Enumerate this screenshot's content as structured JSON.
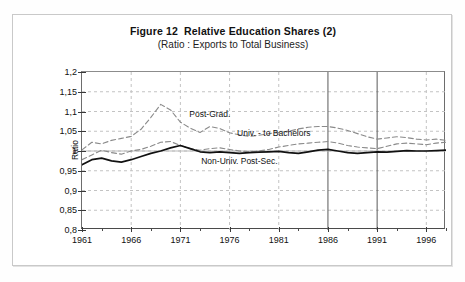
{
  "figure": {
    "title": "Figure 12  Relative Education Shares (2)",
    "subtitle": "(Ratio : Exports to Total Business)"
  },
  "colors": {
    "solid_series": "#111111",
    "dashed_series": "#8a8a8a",
    "gridline": "#c3c3c3",
    "axis": "#4a4a4a",
    "event_line": "#5a5a5a",
    "frame": "#c9c9c9",
    "background": "#ffffff"
  },
  "chart_data": {
    "type": "line",
    "title": "Figure 12  Relative Education Shares (2)",
    "subtitle": "(Ratio : Exports to Total Business)",
    "xlabel": "",
    "ylabel": "Ratio",
    "xlim": [
      1961,
      1998
    ],
    "ylim": [
      0.8,
      1.2
    ],
    "grid": true,
    "legend": "inline-annotations",
    "y_ticks": [
      0.8,
      0.85,
      0.9,
      0.95,
      1,
      1.05,
      1.1,
      1.15,
      1.2
    ],
    "y_tick_labels": [
      "0,8",
      "0,85",
      "0,9",
      "0,95",
      "1",
      "1,05",
      "1,1",
      "1,15",
      "1,2"
    ],
    "x_ticks_major": [
      1961,
      1966,
      1971,
      1976,
      1981,
      1986,
      1991,
      1996
    ],
    "x_tick_labels": [
      "1961",
      "1966",
      "1971",
      "1976",
      "1981",
      "1986",
      "1991",
      "1996"
    ],
    "x_ticks_minor": [
      1963,
      1968,
      1973,
      1978,
      1983,
      1988,
      1993,
      1998
    ],
    "event_lines": [
      1986,
      1991
    ],
    "x": [
      1961,
      1962,
      1963,
      1964,
      1965,
      1966,
      1967,
      1968,
      1969,
      1970,
      1971,
      1972,
      1973,
      1974,
      1975,
      1976,
      1977,
      1978,
      1979,
      1980,
      1981,
      1982,
      1983,
      1984,
      1985,
      1986,
      1987,
      1988,
      1989,
      1990,
      1991,
      1992,
      1993,
      1994,
      1995,
      1996,
      1997,
      1998
    ],
    "series": [
      {
        "name": "Post-Grad.",
        "style": "dashed",
        "color": "#8a8a8a",
        "values": [
          1.003,
          1.022,
          1.018,
          1.027,
          1.032,
          1.037,
          1.055,
          1.085,
          1.118,
          1.104,
          1.073,
          1.058,
          1.047,
          1.062,
          1.057,
          1.046,
          1.041,
          1.037,
          1.04,
          1.044,
          1.047,
          1.05,
          1.056,
          1.06,
          1.062,
          1.062,
          1.058,
          1.052,
          1.044,
          1.036,
          1.03,
          1.033,
          1.036,
          1.034,
          1.03,
          1.028,
          1.03,
          1.027
        ]
      },
      {
        "name": "Univ. - to Bachelors",
        "style": "dashed",
        "color": "#8a8a8a",
        "values": [
          0.978,
          0.99,
          1.002,
          0.996,
          0.992,
          1.0,
          1.004,
          1.012,
          1.022,
          1.024,
          1.014,
          1.006,
          1.002,
          1.006,
          1.008,
          1.004,
          1.0,
          0.998,
          1.0,
          1.004,
          1.01,
          1.014,
          1.018,
          1.02,
          1.022,
          1.024,
          1.02,
          1.014,
          1.01,
          1.008,
          1.006,
          1.012,
          1.018,
          1.02,
          1.018,
          1.016,
          1.02,
          1.022
        ]
      },
      {
        "name": "Non-Univ. Post-Sec.",
        "style": "solid",
        "color": "#111111",
        "values": [
          0.965,
          0.978,
          0.982,
          0.975,
          0.972,
          0.978,
          0.986,
          0.994,
          1.0,
          1.008,
          1.014,
          1.006,
          0.998,
          0.996,
          0.998,
          0.996,
          0.994,
          0.996,
          0.997,
          0.998,
          0.999,
          0.996,
          0.994,
          0.998,
          1.002,
          1.004,
          1.0,
          0.996,
          0.994,
          0.996,
          0.998,
          0.997,
          0.999,
          1.001,
          1.0,
          1.0,
          1.001,
          1.002
        ]
      }
    ],
    "annotations": [
      {
        "text": "Post-Grad.",
        "x": 1974.0,
        "y": 1.092
      },
      {
        "text": "Univ. - to Bachelors",
        "x": 1980.5,
        "y": 1.043
      },
      {
        "text": "Non-Univ. Post-Sec.",
        "x": 1977.0,
        "y": 0.972
      }
    ]
  }
}
